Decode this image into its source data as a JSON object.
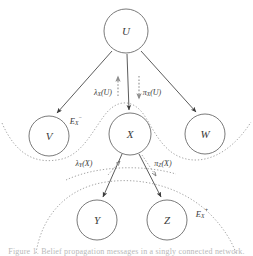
{
  "figure": {
    "kind": "bayesian-network-belief-propagation-diagram",
    "background_color": "#ffffff",
    "node_stroke_color": "#6b6b6b",
    "edge_color": "#4a4a4a",
    "boundary_color": "#9b9b9b",
    "message_color": "#8e8e8e",
    "caption_partial": "Figure 1.  Belief propagation messages in a singly connected network."
  },
  "nodes": [
    {
      "id": "U",
      "label": "U",
      "cx": 126,
      "cy": 31,
      "r": 22
    },
    {
      "id": "V",
      "label": "V",
      "cx": 49,
      "cy": 136,
      "r": 20
    },
    {
      "id": "X",
      "label": "X",
      "cx": 130,
      "cy": 134,
      "r": 21
    },
    {
      "id": "W",
      "label": "W",
      "cx": 205,
      "cy": 134,
      "r": 20
    },
    {
      "id": "Y",
      "label": "Y",
      "cx": 97,
      "cy": 220,
      "r": 20
    },
    {
      "id": "Z",
      "label": "Z",
      "cx": 167,
      "cy": 220,
      "r": 20
    }
  ],
  "edges": [
    {
      "from": "U",
      "to": "V",
      "arrow": true
    },
    {
      "from": "U",
      "to": "X",
      "arrow": true
    },
    {
      "from": "U",
      "to": "W",
      "arrow": true
    },
    {
      "from": "X",
      "to": "Y",
      "arrow": true
    },
    {
      "from": "X",
      "to": "Z",
      "arrow": true
    }
  ],
  "messages": [
    {
      "id": "lambda_x_u",
      "base": "λ",
      "subscript": "X",
      "argument": "(U)",
      "direction": "upward",
      "from": "X",
      "to": "U",
      "label_x": 103,
      "label_y": 93
    },
    {
      "id": "pi_x_u",
      "base": "π",
      "subscript": "X",
      "argument": "(U)",
      "direction": "downward",
      "from": "U",
      "to": "X",
      "label_x": 152,
      "label_y": 93
    },
    {
      "id": "lambda_y_x",
      "base": "λ",
      "subscript": "Y",
      "argument": "(X)",
      "direction": "upward",
      "from": "Y",
      "to": "X",
      "label_x": 84,
      "label_y": 164
    },
    {
      "id": "pi_z_x",
      "base": "π",
      "subscript": "Z",
      "argument": "(X)",
      "direction": "downward",
      "from": "X",
      "to": "Z",
      "label_x": 163,
      "label_y": 164
    }
  ],
  "evidence_labels": [
    {
      "id": "e_x_minus",
      "base": "E",
      "subscript": "X",
      "superscript": "−",
      "x": 76,
      "y": 122,
      "region": "above-X"
    },
    {
      "id": "e_x_plus",
      "base": "E",
      "subscript": "X",
      "superscript": "+",
      "x": 202,
      "y": 215,
      "region": "below-X"
    }
  ],
  "boundaries": [
    {
      "id": "upper-evidence-boundary",
      "description": "wavy dotted curve dipping between V, X and W separating E_X^- region"
    },
    {
      "id": "lower-evidence-boundary",
      "description": "dotted arc enclosing Y and Z, the E_X^+ region"
    }
  ]
}
